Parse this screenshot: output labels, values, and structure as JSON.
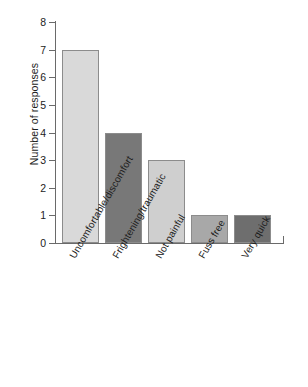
{
  "chart_data": {
    "type": "bar",
    "title": "",
    "xlabel": "",
    "ylabel": "Number of responses",
    "categories": [
      "Uncomfortable/discomfort",
      "Frightening/traumatic",
      "Not painful",
      "Fuss free",
      "Very quick"
    ],
    "values": [
      7,
      4,
      3,
      1,
      1
    ],
    "ylim": [
      0,
      8
    ],
    "ytick_labels": [
      "0",
      "1",
      "2",
      "3",
      "4",
      "5",
      "6",
      "7",
      "8"
    ],
    "ytick_values": [
      0,
      1,
      2,
      3,
      4,
      5,
      6,
      7,
      8
    ],
    "grid": false,
    "legend": "none",
    "bar_colors": [
      "#d9d9d9",
      "#787878",
      "#cfcfcf",
      "#a8a8a8",
      "#6e6e6e"
    ],
    "bar_border_color": "#8c8c8c",
    "axis_color": "#6a6a6a",
    "background": "#ffffff"
  }
}
